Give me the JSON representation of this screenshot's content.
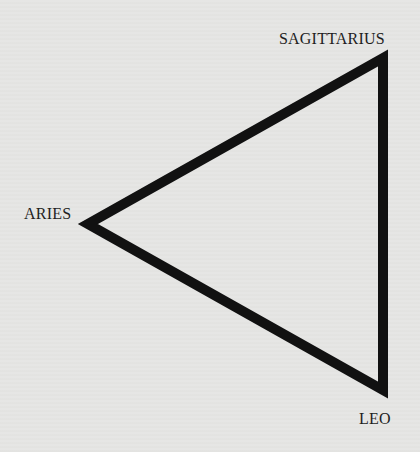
{
  "diagram": {
    "type": "triangle",
    "stroke_color": "#111111",
    "background_color": "#e6e6e4",
    "vertices": [
      {
        "name": "SAGITTARIUS",
        "x": 383,
        "y": 58
      },
      {
        "name": "ARIES",
        "x": 88,
        "y": 224
      },
      {
        "name": "LEO",
        "x": 383,
        "y": 390
      }
    ],
    "labels": {
      "top_right": "SAGITTARIUS",
      "left": "ARIES",
      "bottom_right": "LEO"
    }
  }
}
